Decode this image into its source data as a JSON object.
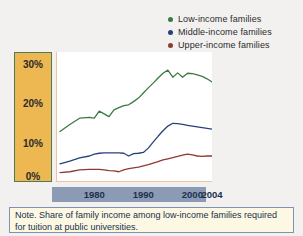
{
  "figure": {
    "background_color": "#f2f1ef"
  },
  "legend": {
    "position": "top-right",
    "items": [
      {
        "label": "Low-income families",
        "color": "#3a7a43",
        "icon": "legend-dot-icon"
      },
      {
        "label": "Middle-income families",
        "color": "#27427a",
        "icon": "legend-dot-icon"
      },
      {
        "label": "Upper-income families",
        "color": "#8f3a32",
        "icon": "legend-dot-icon"
      }
    ]
  },
  "yaxis": {
    "background_color": "#edb752",
    "border_color": "#4f7a57",
    "ticks": [
      "30%",
      "20%",
      "10%",
      "0%"
    ],
    "tick_values": [
      30,
      20,
      10,
      0
    ]
  },
  "xaxis": {
    "band_color": "#8b9ab5",
    "ticks": [
      "1980",
      "1990",
      "2000",
      "2004"
    ],
    "tick_values": [
      1980,
      1990,
      2000,
      2004
    ]
  },
  "note": {
    "text": "Note. Share of family income among low-income families required for tuition at public universities.",
    "background_color": "#fdf8e3",
    "border_color": "#7f92b0"
  },
  "chart_data": {
    "type": "line",
    "title": "",
    "subtitle": "",
    "xlabel": "",
    "ylabel": "",
    "xlim": [
      1973,
      2004
    ],
    "ylim": [
      0,
      33
    ],
    "grid": false,
    "legend_position": "top-right",
    "annotations": [
      "Note. Share of family income among low-income families required for tuition at public universities."
    ],
    "x": [
      1973,
      1975,
      1977,
      1979,
      1980,
      1981,
      1982,
      1983,
      1984,
      1985,
      1986,
      1987,
      1988,
      1989,
      1990,
      1991,
      1992,
      1993,
      1994,
      1995,
      1996,
      1997,
      1998,
      1999,
      2000,
      2001,
      2002,
      2003,
      2004
    ],
    "series": [
      {
        "name": "Low-income families",
        "color": "#3a7a43",
        "values": [
          12.8,
          14.6,
          16.2,
          16.4,
          16.2,
          18.0,
          17.3,
          16.6,
          18.3,
          18.9,
          19.4,
          19.6,
          20.4,
          21.3,
          22.6,
          23.9,
          25.1,
          26.4,
          27.6,
          28.4,
          26.6,
          27.7,
          26.6,
          27.6,
          27.5,
          27.2,
          26.8,
          26.2,
          25.4
        ]
      },
      {
        "name": "Middle-income families",
        "color": "#27427a",
        "values": [
          4.6,
          5.3,
          6.1,
          6.6,
          7.1,
          7.3,
          7.4,
          7.4,
          7.4,
          7.4,
          7.3,
          6.6,
          7.2,
          7.3,
          7.5,
          8.6,
          10.1,
          11.6,
          13.0,
          14.2,
          14.9,
          14.8,
          14.6,
          14.4,
          14.2,
          14.0,
          13.8,
          13.6,
          13.4
        ]
      },
      {
        "name": "Upper-income families",
        "color": "#8f3a32",
        "values": [
          2.4,
          2.6,
          3.1,
          3.2,
          3.2,
          3.2,
          3.1,
          2.9,
          2.8,
          2.6,
          3.1,
          3.4,
          3.6,
          3.8,
          4.1,
          4.4,
          4.8,
          5.2,
          5.6,
          5.9,
          6.2,
          6.5,
          6.8,
          7.1,
          6.9,
          6.6,
          6.5,
          6.6,
          6.6
        ]
      }
    ]
  }
}
